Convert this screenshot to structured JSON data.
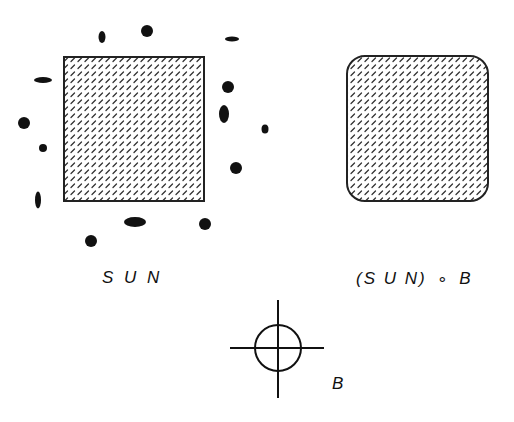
{
  "figure": {
    "left_panel": {
      "label": "S U N",
      "shape": {
        "type": "rectangle",
        "x": 64,
        "y": 57,
        "width": 140,
        "height": 144,
        "fill": "hatched",
        "corner_radius": 0
      },
      "noise_blobs": [
        {
          "cx": 102,
          "cy": 37,
          "rx": 3.5,
          "ry": 6
        },
        {
          "cx": 147,
          "cy": 31,
          "rx": 6,
          "ry": 6
        },
        {
          "cx": 232,
          "cy": 39,
          "rx": 7,
          "ry": 2.5
        },
        {
          "cx": 43,
          "cy": 80,
          "rx": 9,
          "ry": 3
        },
        {
          "cx": 228,
          "cy": 87,
          "rx": 6,
          "ry": 6
        },
        {
          "cx": 224,
          "cy": 114,
          "rx": 5,
          "ry": 9
        },
        {
          "cx": 24,
          "cy": 123,
          "rx": 6,
          "ry": 6
        },
        {
          "cx": 265,
          "cy": 129,
          "rx": 3.5,
          "ry": 4.5
        },
        {
          "cx": 43,
          "cy": 148,
          "rx": 4,
          "ry": 4
        },
        {
          "cx": 236,
          "cy": 168,
          "rx": 6,
          "ry": 6
        },
        {
          "cx": 38,
          "cy": 200,
          "rx": 3,
          "ry": 8.5
        },
        {
          "cx": 135,
          "cy": 222,
          "rx": 11,
          "ry": 5
        },
        {
          "cx": 205,
          "cy": 224,
          "rx": 6,
          "ry": 6
        },
        {
          "cx": 91,
          "cy": 241,
          "rx": 6,
          "ry": 6
        }
      ]
    },
    "right_panel": {
      "label": "(S U N) ∘ B",
      "label_parts": [
        "(S U N)",
        "∘",
        "B"
      ],
      "shape": {
        "type": "rounded-rectangle",
        "x": 347,
        "y": 56,
        "width": 141,
        "height": 145,
        "fill": "hatched",
        "corner_radius": 18
      }
    },
    "structuring_element": {
      "label": "B",
      "center": {
        "x": 278,
        "y": 348
      },
      "radius": 23,
      "h_line": {
        "x1": 230,
        "x2": 324
      },
      "v_line": {
        "y1": 300,
        "y2": 398
      }
    },
    "colors": {
      "ink": "#111111",
      "hatch": "#333333",
      "background": "#ffffff"
    }
  }
}
